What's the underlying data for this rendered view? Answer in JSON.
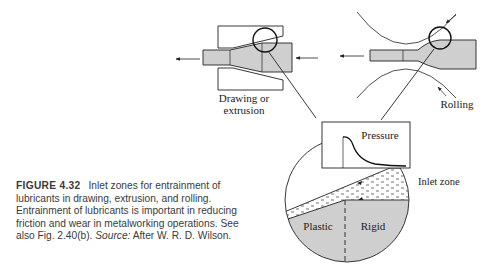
{
  "figure": {
    "number": "FIGURE 4.32",
    "caption_text": "Inlet zones for entrainment of lubricants in drawing, extrusion, and rolling. Entrainment of lubricants is important in reducing friction and wear in metalworking operations. See also Fig. 2.40(b).",
    "source_label": "Source:",
    "source_text": "After W. R. D. Wilson."
  },
  "labels": {
    "drawing_line1": "Drawing or",
    "drawing_line2": "extrusion",
    "rolling": "Rolling",
    "pressure": "Pressure",
    "inlet_zone": "Inlet zone",
    "plastic": "Plastic",
    "rigid": "Rigid"
  },
  "colors": {
    "workpiece_fill": "#cfcfcf",
    "line": "#222222",
    "background": "#ffffff"
  }
}
